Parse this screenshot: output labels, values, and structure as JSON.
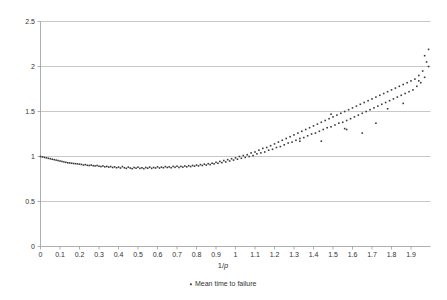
{
  "chart_data": {
    "type": "scatter",
    "title": "",
    "xlabel": "1/p",
    "ylabel": "",
    "xlim": [
      0,
      2.0
    ],
    "ylim": [
      0,
      2.5
    ],
    "grid": "horizontal",
    "legend_position": "bottom",
    "series": [
      {
        "name": "Mean time to failure",
        "marker": "dot",
        "color": "#3b3b3b",
        "x": [
          0.0,
          0.01,
          0.02,
          0.03,
          0.04,
          0.05,
          0.06,
          0.07,
          0.08,
          0.09,
          0.1,
          0.11,
          0.12,
          0.13,
          0.14,
          0.15,
          0.16,
          0.17,
          0.18,
          0.19,
          0.2,
          0.21,
          0.22,
          0.23,
          0.24,
          0.25,
          0.26,
          0.27,
          0.28,
          0.29,
          0.3,
          0.31,
          0.32,
          0.33,
          0.34,
          0.35,
          0.36,
          0.37,
          0.38,
          0.39,
          0.4,
          0.41,
          0.42,
          0.43,
          0.44,
          0.45,
          0.46,
          0.47,
          0.48,
          0.49,
          0.5,
          0.51,
          0.52,
          0.53,
          0.54,
          0.55,
          0.56,
          0.57,
          0.58,
          0.59,
          0.6,
          0.61,
          0.62,
          0.63,
          0.64,
          0.65,
          0.66,
          0.67,
          0.68,
          0.69,
          0.7,
          0.71,
          0.72,
          0.73,
          0.74,
          0.75,
          0.76,
          0.77,
          0.78,
          0.79,
          0.8,
          0.81,
          0.82,
          0.83,
          0.84,
          0.85,
          0.86,
          0.87,
          0.88,
          0.89,
          0.9,
          0.91,
          0.92,
          0.93,
          0.94,
          0.95,
          0.96,
          0.97,
          0.98,
          0.99,
          1.0,
          1.01,
          1.02,
          1.03,
          1.04,
          1.05,
          1.06,
          1.07,
          1.08,
          1.09,
          1.1,
          1.11,
          1.12,
          1.13,
          1.14,
          1.15,
          1.16,
          1.17,
          1.18,
          1.19,
          1.2,
          1.21,
          1.22,
          1.23,
          1.24,
          1.25,
          1.26,
          1.27,
          1.28,
          1.29,
          1.3,
          1.31,
          1.32,
          1.33,
          1.34,
          1.35,
          1.36,
          1.37,
          1.38,
          1.39,
          1.4,
          1.41,
          1.42,
          1.43,
          1.44,
          1.45,
          1.46,
          1.47,
          1.48,
          1.49,
          1.5,
          1.51,
          1.52,
          1.53,
          1.54,
          1.55,
          1.56,
          1.57,
          1.58,
          1.59,
          1.6,
          1.61,
          1.62,
          1.63,
          1.64,
          1.65,
          1.66,
          1.67,
          1.68,
          1.69,
          1.7,
          1.71,
          1.72,
          1.73,
          1.74,
          1.75,
          1.76,
          1.77,
          1.78,
          1.79,
          1.8,
          1.81,
          1.82,
          1.83,
          1.84,
          1.85,
          1.86,
          1.87,
          1.88,
          1.89,
          1.9,
          1.91,
          1.92,
          1.93,
          1.94,
          1.95,
          1.96,
          1.97,
          1.98,
          1.99
        ],
        "y": [
          1.0,
          0.995,
          0.99,
          0.985,
          0.98,
          0.975,
          0.97,
          0.965,
          0.96,
          0.955,
          0.95,
          0.945,
          0.94,
          0.935,
          0.93,
          0.928,
          0.925,
          0.922,
          0.92,
          0.918,
          0.915,
          0.912,
          0.905,
          0.91,
          0.902,
          0.9,
          0.905,
          0.898,
          0.895,
          0.9,
          0.892,
          0.888,
          0.895,
          0.885,
          0.89,
          0.882,
          0.888,
          0.878,
          0.885,
          0.875,
          0.882,
          0.872,
          0.888,
          0.875,
          0.868,
          0.882,
          0.872,
          0.865,
          0.878,
          0.87,
          0.882,
          0.868,
          0.875,
          0.865,
          0.878,
          0.87,
          0.882,
          0.868,
          0.878,
          0.872,
          0.885,
          0.872,
          0.882,
          0.875,
          0.888,
          0.878,
          0.885,
          0.875,
          0.89,
          0.88,
          0.892,
          0.878,
          0.89,
          0.882,
          0.895,
          0.885,
          0.898,
          0.888,
          0.9,
          0.892,
          0.905,
          0.895,
          0.91,
          0.9,
          0.915,
          0.905,
          0.92,
          0.91,
          0.925,
          0.918,
          0.935,
          0.925,
          0.945,
          0.932,
          0.955,
          0.94,
          0.965,
          0.95,
          0.975,
          0.96,
          0.985,
          0.97,
          1.0,
          0.98,
          1.01,
          0.99,
          1.02,
          1.0,
          1.04,
          1.01,
          1.05,
          1.03,
          1.07,
          1.04,
          1.09,
          1.05,
          1.1,
          1.07,
          1.12,
          1.08,
          1.14,
          1.1,
          1.16,
          1.11,
          1.18,
          1.13,
          1.2,
          1.15,
          1.22,
          1.16,
          1.24,
          1.18,
          1.26,
          1.2,
          1.28,
          1.21,
          1.3,
          1.23,
          1.32,
          1.25,
          1.34,
          1.26,
          1.36,
          1.28,
          1.38,
          1.3,
          1.4,
          1.32,
          1.42,
          1.33,
          1.44,
          1.35,
          1.46,
          1.37,
          1.48,
          1.38,
          1.5,
          1.4,
          1.52,
          1.42,
          1.54,
          1.44,
          1.56,
          1.46,
          1.58,
          1.48,
          1.6,
          1.5,
          1.62,
          1.52,
          1.64,
          1.54,
          1.66,
          1.56,
          1.68,
          1.58,
          1.7,
          1.6,
          1.72,
          1.62,
          1.74,
          1.64,
          1.76,
          1.66,
          1.78,
          1.68,
          1.8,
          1.7,
          1.82,
          1.72,
          1.84,
          1.74,
          1.86,
          1.78,
          1.9,
          1.82,
          1.95,
          1.88,
          2.05,
          2.0
        ],
        "outliers_x": [
          1.33,
          1.44,
          1.49,
          1.56,
          1.57,
          1.65,
          1.72,
          1.78,
          1.86,
          1.94,
          1.97,
          1.99
        ],
        "outliers_y": [
          1.17,
          1.17,
          1.47,
          1.31,
          1.3,
          1.26,
          1.37,
          1.53,
          1.59,
          1.84,
          2.12,
          2.19
        ]
      }
    ],
    "yticks": [
      "0",
      "0.5",
      "1",
      "1.5",
      "2",
      "2.5"
    ],
    "ytick_values": [
      0,
      0.5,
      1,
      1.5,
      2,
      2.5
    ],
    "xticks": [
      "0",
      "0.1",
      "0.2",
      "0.3",
      "0.4",
      "0.5",
      "0.6",
      "0.7",
      "0.8",
      "0.9",
      "1",
      "1.1",
      "1.2",
      "1.3",
      "1.4",
      "1.5",
      "1.6",
      "1.7",
      "1.8",
      "1.9"
    ],
    "xtick_values": [
      0,
      0.1,
      0.2,
      0.3,
      0.4,
      0.5,
      0.6,
      0.7,
      0.8,
      0.9,
      1.0,
      1.1,
      1.2,
      1.3,
      1.4,
      1.5,
      1.6,
      1.7,
      1.8,
      1.9
    ]
  },
  "legend": {
    "entries": [
      {
        "label": "Mean time to failure",
        "marker_color": "#3b3b3b"
      }
    ]
  },
  "axis": {
    "x_title_prefix": "1/",
    "x_title_italic": "p"
  },
  "colors": {
    "background": "#ffffff",
    "grid": "#b0b0b0",
    "frame": "#9a9a9a",
    "marker": "#3b3b3b",
    "text": "#333333"
  }
}
